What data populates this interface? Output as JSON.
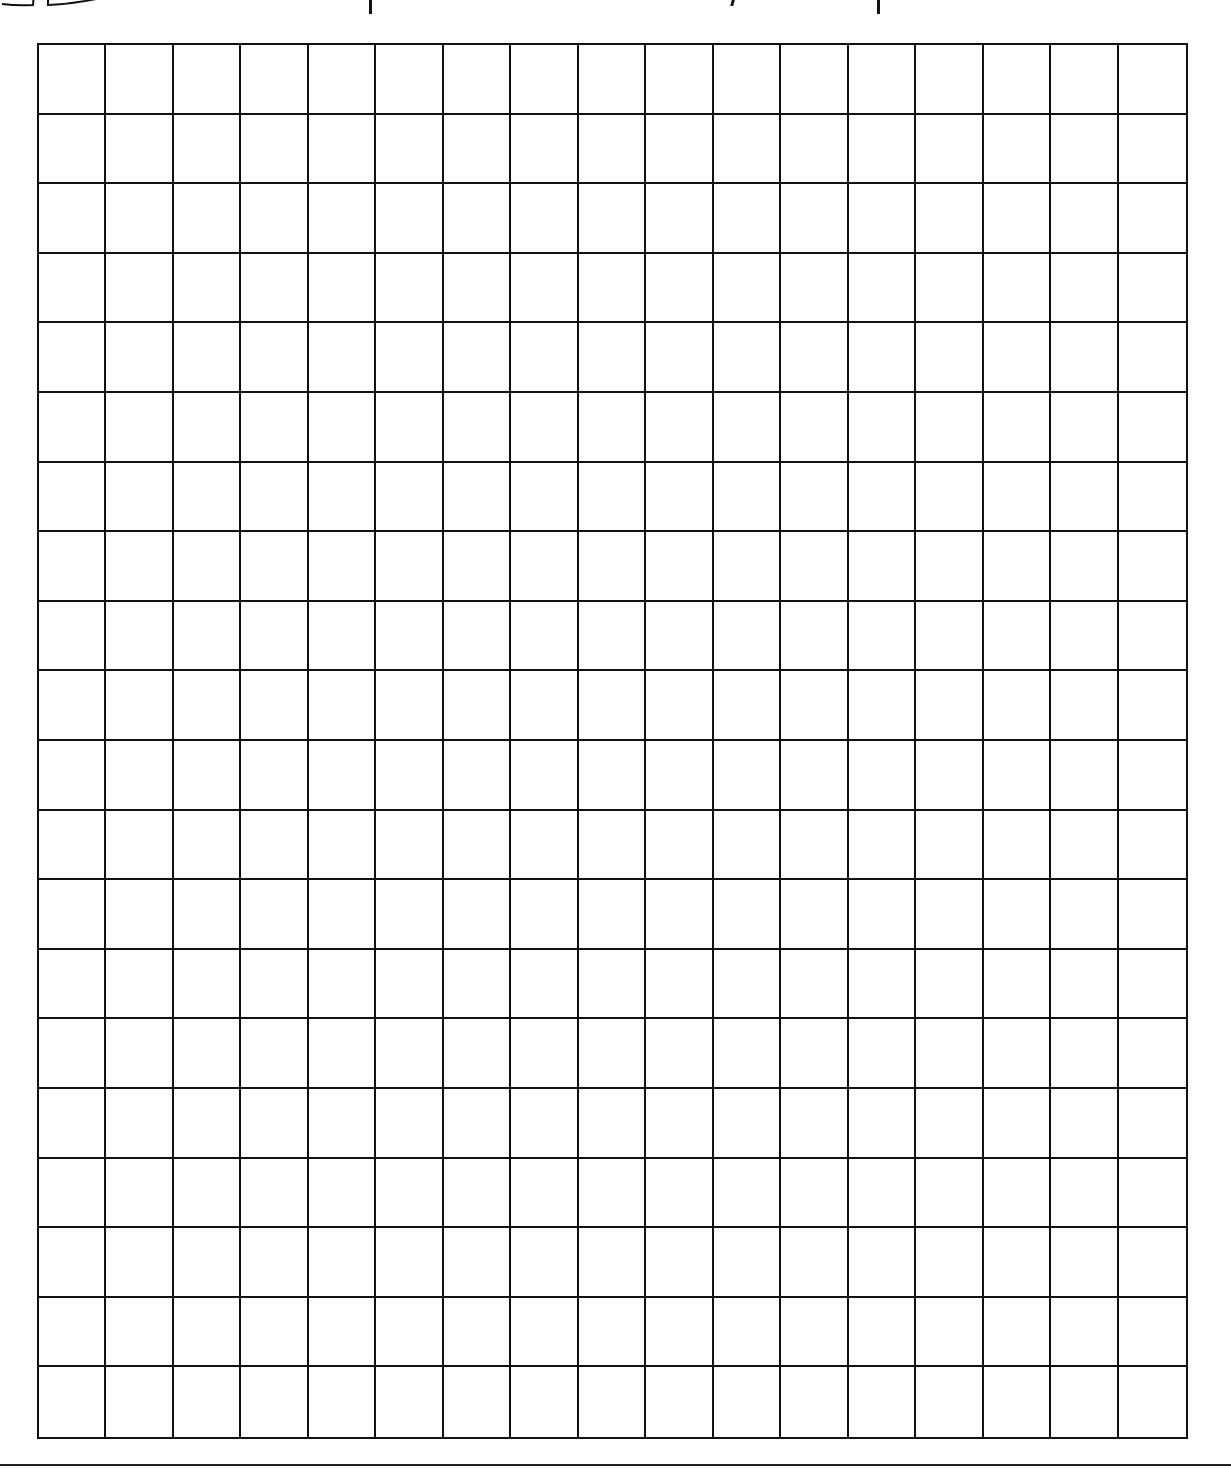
{
  "worksheet": {
    "type": "graph-paper",
    "header_icon": "open-book-icon",
    "header_text_visible": false,
    "grid": {
      "columns": 17,
      "rows": 20,
      "line_color": "#111111",
      "background": "#ffffff"
    },
    "footer_rule": true
  }
}
